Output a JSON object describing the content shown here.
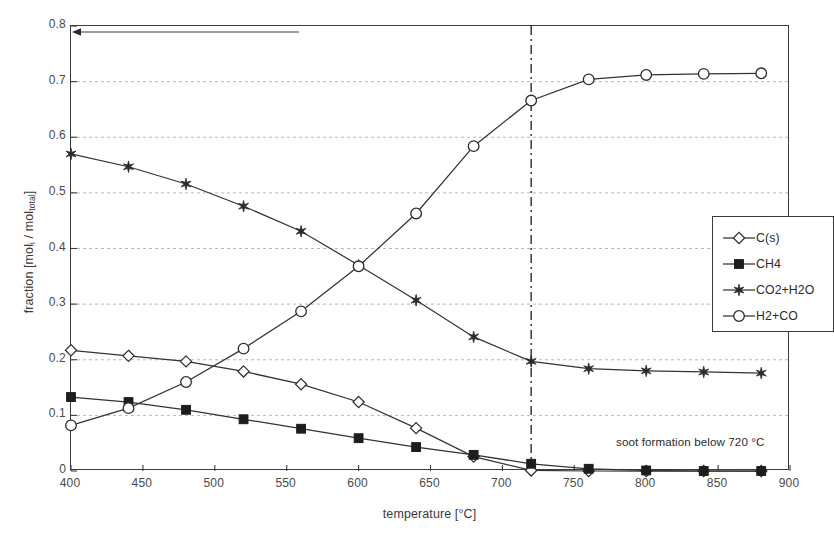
{
  "chart_data": {
    "type": "line",
    "title": "",
    "xlabel": "temperature [°C]",
    "ylabel_prefix": "fraction [mol",
    "ylabel_sub1": "i",
    "ylabel_mid": " / mol",
    "ylabel_sub2": "total",
    "ylabel_suffix": "]",
    "ylabel_plain": "fraction [mol_i / mol_total]",
    "x": [
      400,
      440,
      480,
      520,
      560,
      600,
      640,
      680,
      720,
      760,
      800,
      840,
      880
    ],
    "xlim": [
      400,
      900
    ],
    "ylim": [
      0,
      0.8
    ],
    "xticks": [
      400,
      450,
      500,
      550,
      600,
      650,
      700,
      750,
      800,
      850,
      900
    ],
    "yticks": [
      0,
      0.1,
      0.2,
      0.3,
      0.4,
      0.5,
      0.6,
      0.7,
      0.8
    ],
    "ytick_labels": [
      "0",
      "0.1",
      "0.2",
      "0.3",
      "0.4",
      "0.5",
      "0.6",
      "0.7",
      "0.8"
    ],
    "xtick_labels": [
      "400",
      "450",
      "500",
      "550",
      "600",
      "650",
      "700",
      "750",
      "800",
      "850",
      "900"
    ],
    "grid": "horizontal-dashed",
    "legend_position": "inside-right",
    "series": [
      {
        "name": "C(s)",
        "marker": "diamond-open",
        "values": [
          0.217,
          0.207,
          0.197,
          0.179,
          0.156,
          0.124,
          0.077,
          0.026,
          0.001,
          0.0,
          0.0,
          0.0,
          0.0
        ]
      },
      {
        "name": "CH4",
        "marker": "square-filled",
        "values": [
          0.133,
          0.124,
          0.11,
          0.093,
          0.076,
          0.059,
          0.043,
          0.029,
          0.013,
          0.004,
          0.001,
          0.0,
          0.0
        ]
      },
      {
        "name": "CO2+H2O",
        "marker": "star",
        "values": [
          0.57,
          0.547,
          0.516,
          0.476,
          0.431,
          0.37,
          0.307,
          0.241,
          0.197,
          0.184,
          0.18,
          0.178,
          0.176
        ]
      },
      {
        "name": "H2+CO",
        "marker": "circle-open",
        "values": [
          0.082,
          0.113,
          0.16,
          0.22,
          0.287,
          0.368,
          0.463,
          0.584,
          0.666,
          0.704,
          0.712,
          0.714,
          0.715
        ]
      }
    ],
    "annotations": [
      {
        "name": "soot-formation-marker",
        "text": "soot formation below 720 °C",
        "x_value": 720,
        "line_style": "dash-dot-vertical",
        "arrow": "left"
      }
    ],
    "colors": {
      "axis": "#3c3c3c",
      "grid": "#b9b9b9",
      "series_line": "#333333",
      "background": "#ffffff"
    }
  },
  "legend": {
    "entries": [
      {
        "label": "C(s)",
        "marker": "diamond-open"
      },
      {
        "label": "CH4",
        "marker": "square-filled"
      },
      {
        "label": "CO2+H2O",
        "marker": "star"
      },
      {
        "label": "H2+CO",
        "marker": "circle-open"
      }
    ]
  },
  "caption_strip": ""
}
